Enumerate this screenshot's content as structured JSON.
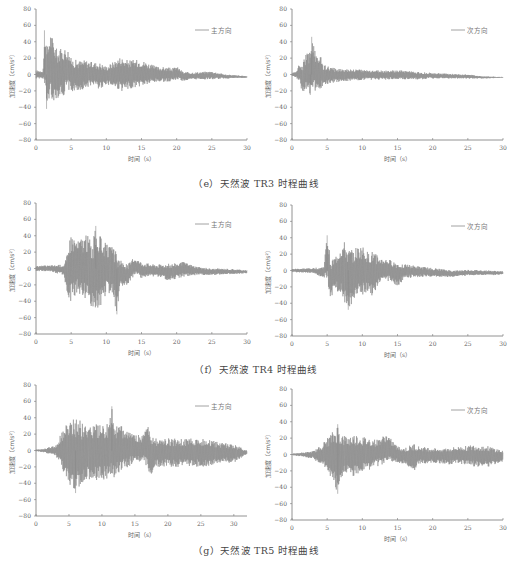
{
  "figure": {
    "captions": {
      "e": "（e）天然波 TR3 时程曲线",
      "f": "（f）天然波 TR4 时程曲线",
      "g": "（g）天然波 TR5 时程曲线"
    },
    "axis": {
      "xlabel": "时间（s）",
      "ylabel": "加速度（cm/s²）",
      "yticks": [
        "80",
        "60",
        "40",
        "20",
        "0",
        "−20",
        "−40",
        "−60",
        "−80"
      ],
      "xticks": [
        "0",
        "5",
        "10",
        "15",
        "20",
        "25",
        "30"
      ]
    },
    "line_color": "#8a8a8a"
  },
  "chart_data": [
    {
      "id": "TR3-main",
      "panel": "e",
      "type": "line",
      "title": "",
      "legend": "主方向",
      "xlabel": "时间（s）",
      "ylabel": "加速度（cm/s²）",
      "xlim": [
        0,
        30
      ],
      "ylim": [
        -80,
        80
      ],
      "grid": false,
      "legend_position": "upper right",
      "envelope": {
        "t": [
          0,
          1,
          1.3,
          1.5,
          2,
          2.5,
          3,
          4,
          4.5,
          5,
          6,
          7,
          8,
          9,
          10,
          12,
          12.5,
          13,
          15,
          17,
          19.5,
          20,
          21,
          23,
          25,
          27,
          30
        ],
        "max": [
          5,
          5,
          54,
          30,
          53,
          43,
          30,
          33,
          32,
          20,
          17,
          18,
          15,
          15,
          10,
          22,
          20,
          18,
          18,
          10,
          8,
          10,
          3,
          3,
          4,
          0,
          -2
        ],
        "min": [
          -5,
          -5,
          -20,
          -42,
          -30,
          -32,
          -30,
          -25,
          -18,
          -22,
          -20,
          -18,
          -12,
          -18,
          -12,
          -20,
          -22,
          -18,
          -15,
          -10,
          -8,
          -6,
          -8,
          -6,
          -6,
          -5,
          -4
        ]
      },
      "peak_positive": {
        "t": 1.2,
        "value": 54
      },
      "peak_negative": {
        "t": 1.5,
        "value": -42
      }
    },
    {
      "id": "TR3-secondary",
      "panel": "e",
      "type": "line",
      "title": "",
      "legend": "次方向",
      "xlabel": "时间（s）",
      "ylabel": "加速度（cm/s²）",
      "xlim": [
        0,
        30
      ],
      "ylim": [
        -80,
        80
      ],
      "grid": false,
      "legend_position": "upper right",
      "envelope": {
        "t": [
          0,
          0.5,
          1,
          1.5,
          2,
          2.5,
          3,
          3.5,
          4,
          4.5,
          5,
          6,
          8,
          10,
          12,
          14,
          16,
          18,
          20,
          22,
          25,
          27,
          30
        ],
        "max": [
          2,
          3,
          12,
          14,
          25,
          28,
          46,
          20,
          28,
          12,
          10,
          8,
          7,
          6,
          5,
          5,
          5,
          3,
          2,
          1,
          0,
          -2,
          -3
        ],
        "min": [
          -2,
          -3,
          -8,
          -22,
          -18,
          -25,
          -25,
          -20,
          -18,
          -15,
          -12,
          -10,
          -8,
          -7,
          -7,
          -6,
          -6,
          -6,
          -5,
          -5,
          -5,
          -5,
          -4
        ]
      },
      "peak_positive": {
        "t": 2.8,
        "value": 46
      },
      "peak_negative": {
        "t": 2.6,
        "value": -25
      }
    },
    {
      "id": "TR4-main",
      "panel": "f",
      "type": "line",
      "title": "",
      "legend": "主方向",
      "xlabel": "时间（s）",
      "ylabel": "加速度（cm/s²）",
      "xlim": [
        0,
        30
      ],
      "ylim": [
        -80,
        80
      ],
      "grid": false,
      "legend_position": "upper right",
      "envelope": {
        "t": [
          0,
          2,
          4,
          4.5,
          5,
          6,
          6.5,
          7.5,
          8,
          8.5,
          9,
          10,
          11,
          11.5,
          12,
          13,
          14,
          15,
          17,
          19,
          21,
          23,
          25,
          27,
          30
        ],
        "max": [
          3,
          4,
          5,
          20,
          44,
          35,
          40,
          42,
          30,
          52,
          42,
          30,
          25,
          20,
          10,
          5,
          14,
          8,
          5,
          6,
          8,
          2,
          0,
          0,
          -2
        ],
        "min": [
          -3,
          -4,
          -8,
          -42,
          -40,
          -30,
          -35,
          -40,
          -52,
          -55,
          -50,
          -30,
          -35,
          -56,
          -22,
          -20,
          -8,
          -12,
          -10,
          -15,
          -10,
          -8,
          -8,
          -7,
          -6
        ]
      },
      "peak_positive": {
        "t": 8.5,
        "value": 52
      },
      "peak_negative": {
        "t": 11.5,
        "value": -56
      }
    },
    {
      "id": "TR4-secondary",
      "panel": "f",
      "type": "line",
      "title": "",
      "legend": "次方向",
      "xlabel": "时间（s）",
      "ylabel": "加速度（cm/s²）",
      "xlim": [
        0,
        30
      ],
      "ylim": [
        -80,
        80
      ],
      "grid": false,
      "legend_position": "upper right",
      "envelope": {
        "t": [
          0,
          3,
          4.5,
          5,
          5.5,
          6,
          7,
          7.5,
          8,
          9,
          10,
          11,
          11.5,
          12.5,
          13.5,
          15,
          16,
          18,
          20,
          23,
          25,
          28,
          30
        ],
        "max": [
          2,
          3,
          5,
          43,
          15,
          15,
          30,
          35,
          25,
          28,
          30,
          20,
          24,
          15,
          14,
          10,
          8,
          5,
          3,
          0,
          1,
          0,
          -1
        ],
        "min": [
          -2,
          -3,
          -10,
          -12,
          -36,
          -25,
          -28,
          -40,
          -48,
          -35,
          -30,
          -25,
          -33,
          -15,
          -12,
          -20,
          -10,
          -8,
          -8,
          -8,
          -6,
          -6,
          -5
        ]
      },
      "peak_positive": {
        "t": 5,
        "value": 43
      },
      "peak_negative": {
        "t": 8,
        "value": -48
      }
    },
    {
      "id": "TR5-main",
      "panel": "g",
      "type": "line",
      "title": "",
      "legend": "主方向",
      "xlabel": "时间（s）",
      "ylabel": "加速度（cm/s²）",
      "xlim": [
        0,
        32
      ],
      "ylim": [
        -80,
        80
      ],
      "grid": false,
      "legend_position": "upper right",
      "envelope": {
        "t": [
          0,
          1,
          3,
          4,
          5,
          6,
          7,
          8,
          10,
          11,
          11.5,
          12,
          13,
          15,
          16,
          17,
          17.5,
          18,
          20,
          22,
          24,
          26,
          28,
          30,
          32
        ],
        "max": [
          1,
          2,
          6,
          25,
          38,
          42,
          35,
          35,
          30,
          35,
          54,
          30,
          30,
          20,
          18,
          38,
          20,
          15,
          15,
          14,
          15,
          14,
          10,
          8,
          0
        ],
        "min": [
          -1,
          -2,
          -6,
          -25,
          -40,
          -52,
          -45,
          -38,
          -35,
          -38,
          -35,
          -32,
          -25,
          -15,
          -15,
          -20,
          -44,
          -20,
          -20,
          -20,
          -20,
          -20,
          -15,
          -15,
          -5
        ]
      },
      "peak_positive": {
        "t": 11.5,
        "value": 54
      },
      "peak_negative": {
        "t": 6,
        "value": -52
      }
    },
    {
      "id": "TR5-secondary",
      "panel": "g",
      "type": "line",
      "title": "",
      "legend": "次方向",
      "xlabel": "时间（s）",
      "ylabel": "加速度（cm/s²）",
      "xlim": [
        0,
        30
      ],
      "ylim": [
        -80,
        80
      ],
      "grid": false,
      "legend_position": "upper right",
      "envelope": {
        "t": [
          0,
          1,
          3,
          4,
          5,
          6,
          6.5,
          7,
          8,
          9,
          10,
          12,
          13.5,
          15,
          16,
          17,
          17.5,
          18,
          20,
          22,
          24,
          26,
          28,
          30
        ],
        "max": [
          1,
          2,
          4,
          10,
          20,
          30,
          37,
          25,
          22,
          25,
          22,
          18,
          25,
          10,
          8,
          12,
          14,
          10,
          8,
          8,
          10,
          12,
          10,
          5
        ],
        "min": [
          -1,
          -2,
          -5,
          -12,
          -20,
          -38,
          -48,
          -30,
          -25,
          -28,
          -22,
          -15,
          -10,
          -10,
          -12,
          -20,
          -22,
          -12,
          -10,
          -12,
          -12,
          -15,
          -15,
          -10
        ]
      },
      "peak_positive": {
        "t": 6.5,
        "value": 37
      },
      "peak_negative": {
        "t": 6.5,
        "value": -48
      }
    }
  ]
}
